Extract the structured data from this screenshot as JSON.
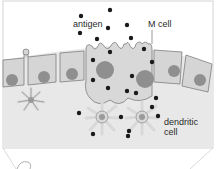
{
  "diagram": {
    "labels": {
      "antigen": "antigen",
      "m_cell": "M cell",
      "dendritic_line1": "dendritic",
      "dendritic_line2": "cell"
    },
    "colors": {
      "background": "#ffffff",
      "tissue": "#e6e6e6",
      "cell_fill": "#d6d6d6",
      "cell_stroke": "#7a7a7a",
      "nucleus": "#8f8f8f",
      "antigen_dot": "#1a1a1a",
      "frame": "#cfcfcf"
    }
  }
}
